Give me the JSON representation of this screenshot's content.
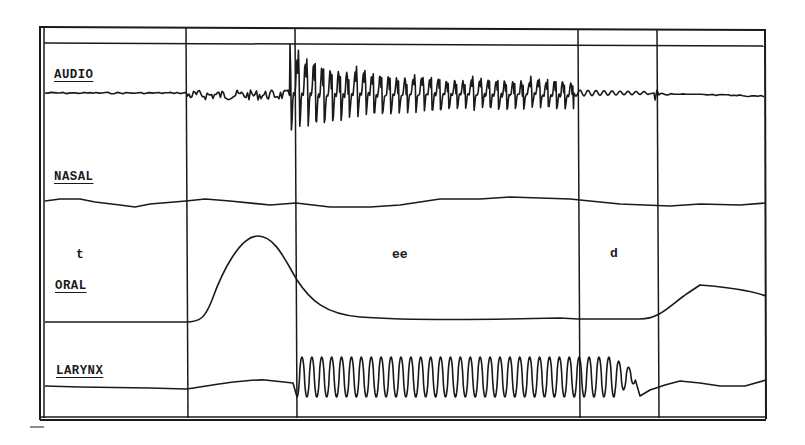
{
  "chart_data": {
    "type": "line",
    "title": "",
    "xlabel": "",
    "ylabel": "",
    "grid": false,
    "legend": "none",
    "channels": [
      {
        "name": "AUDIO",
        "description": "Low-amplitude noise during t-burst, large periodic oscillation during ee decaying slightly, small damped ripples in d closure, flat afterwards"
      },
      {
        "name": "NASAL",
        "description": "Nearly flat trace with minor drift throughout"
      },
      {
        "name": "ORAL",
        "description": "Flat baseline, large smooth peak (aspiration of t) centered near the t-release segment, decays through ee, flat during d, rises to plateau after release"
      },
      {
        "name": "LARYNX",
        "description": "Flat with slight hump before voicing; strong periodic vibration (~34 cycles) throughout ee and into d closure, then stops; slow drift afterwards"
      }
    ],
    "segments": [
      {
        "label": "t",
        "x_start_px": 44,
        "x_end_px": 186
      },
      {
        "label": "",
        "x_start_px": 186,
        "x_end_px": 295
      },
      {
        "label": "ee",
        "x_start_px": 295,
        "x_end_px": 578
      },
      {
        "label": "d",
        "x_start_px": 578,
        "x_end_px": 657
      },
      {
        "label": "",
        "x_start_px": 657,
        "x_end_px": 765
      }
    ],
    "segment_boundaries_px": [
      186,
      295,
      578,
      657
    ],
    "voicing_cycles_approx": 34
  },
  "labels": {
    "audio": "AUDIO",
    "nasal": "NASAL",
    "oral": "ORAL",
    "larynx": "LARYNX"
  },
  "segment_labels": {
    "t": "t",
    "ee": "ee",
    "d": "d"
  },
  "colors": {
    "ink": "#1a1a1a",
    "paper": "#ffffff"
  }
}
